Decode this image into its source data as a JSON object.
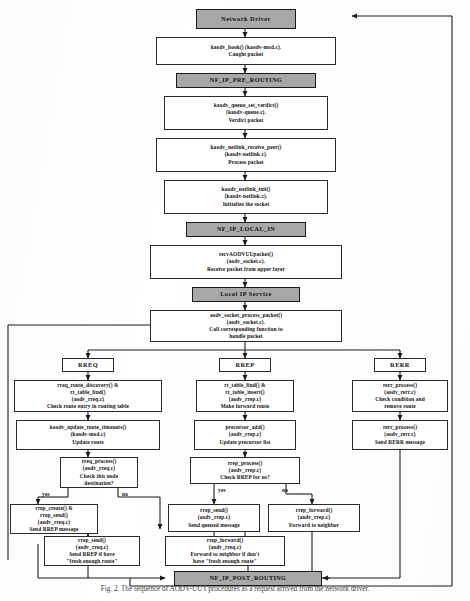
{
  "figure": {
    "caption": "Fig. 2. The sequence of AODV-UU's procedures as a request arrived from the network driver."
  },
  "nodes": {
    "network_driver": {
      "lines": [
        "Network Driver"
      ]
    },
    "kaodv_hook": {
      "lines": [
        "kaodv_hook() (kaodv-mod.c).",
        "Caught packet"
      ]
    },
    "nf_pre_routing": {
      "lines": [
        "NF_IP_PRE_ROUTING"
      ]
    },
    "queue_set_verdict": {
      "lines": [
        "kaodv_queue_set_verdict()",
        "(kaodv-queue.c).",
        "Verdict packet"
      ]
    },
    "netlink_recv_peer": {
      "lines": [
        "kaodv_netlink_receive_peer()",
        "(kaodv-netlink.c).",
        "Process packet"
      ]
    },
    "netlink_init": {
      "lines": [
        "kaodv_netlink_init()",
        "(kaodv-netlink.c).",
        "Initialize the socket"
      ]
    },
    "nf_local_in": {
      "lines": [
        "NF_IP_LOCAL_IN"
      ]
    },
    "recv_aodvuu": {
      "lines": [
        "recvAODVUUpacket()",
        "(aodv_socket.c).",
        "Receive packet from upper layer"
      ]
    },
    "local_ip_service": {
      "lines": [
        "Local IP Service"
      ]
    },
    "socket_process": {
      "lines": [
        "aodv_socket_process_packet()",
        "(aodv_socket.c).",
        "Call corresponding function to",
        "handle packet"
      ]
    },
    "rreq_tag": {
      "lines": [
        "RREQ"
      ]
    },
    "rrep_tag": {
      "lines": [
        "RREP"
      ]
    },
    "rerr_tag": {
      "lines": [
        "RERR"
      ]
    },
    "rreq_discovery": {
      "lines": [
        "rreq_route_discovery() &",
        "rt_table_find()",
        "(aodv_rreq.c)",
        "Check route entry in routing table"
      ]
    },
    "update_timeouts": {
      "lines": [
        "kaodv_update_route_timeouts()",
        "(kaodv-mod.c)",
        "Update route"
      ]
    },
    "rreq_process": {
      "lines": [
        "rreq_process()",
        "(aodv_rreq.c)",
        "Check this node",
        "destination?"
      ]
    },
    "rrep_create_send": {
      "lines": [
        "rrep_create() &",
        "rrep_send()",
        "(aodv_rreq.c)",
        "Send RREP message"
      ]
    },
    "rrep_send_fresh": {
      "lines": [
        "rrep_send()",
        "(aodv_rreq.c)",
        "Send RREP if have",
        "\"fresh enough route\""
      ]
    },
    "rt_find_insert": {
      "lines": [
        "rt_table_find() &",
        "rt_table_insert()",
        "(aodv_rrep.c)",
        "Make forward route"
      ]
    },
    "precursor_add": {
      "lines": [
        "precursor_add()",
        "(aodv_rrep.c)",
        "Update precursor list"
      ]
    },
    "rrep_process": {
      "lines": [
        "rrep_process()",
        "(aodv_rrep.c)",
        "Check RREP for us?"
      ]
    },
    "rrep_send_queued": {
      "lines": [
        "rrep_send()",
        "(aodv_rrep.c)",
        "Send queued message"
      ]
    },
    "rrep_forward_nb": {
      "lines": [
        "rrep_forward()",
        "(aodv_rrep.c)",
        "Forward to neighbor"
      ]
    },
    "rrep_forward_fresh": {
      "lines": [
        "rrep_forward()",
        "(aodv_rreq.c)",
        "Forward to neighbor if don't",
        "have \"fresh enough route\""
      ]
    },
    "rerr_process": {
      "lines": [
        "rerr_process()",
        "(aodv_rerr.c)",
        "Check condition and",
        "remove route"
      ]
    },
    "rerr_send": {
      "lines": [
        "rerr_process()",
        "(aodv_rerr.c)",
        "Send RERR message"
      ]
    },
    "nf_post_routing": {
      "lines": [
        "NF_IP_POST_ROUTING"
      ]
    }
  },
  "edge_labels": {
    "rreq_yes": "yes",
    "rreq_no": "no",
    "rrep_yes": "yes",
    "rrep_no": "no"
  },
  "colors": {
    "shaded_fill": "#a8a8a8",
    "box_border": "#2a2a2a",
    "text": "#111111",
    "page": "#ffffff"
  }
}
